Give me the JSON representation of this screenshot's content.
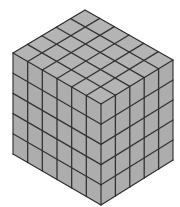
{
  "diagram": {
    "title": "",
    "block": {
      "cubes_along_left_face": 6,
      "cubes_along_right_face": 5,
      "cubes_height": 5,
      "total_cubes": 150
    },
    "geometry": {
      "top_vertex": [
        85,
        10
      ],
      "left_top_vertex": [
        13,
        53
      ],
      "right_top_vertex": [
        173,
        60
      ],
      "front_top_vertex": [
        101,
        104
      ],
      "left_bottom_vertex": [
        13,
        154
      ],
      "right_bottom_vertex": [
        173,
        160
      ],
      "front_bottom_vertex": [
        101,
        205
      ]
    },
    "colors": {
      "background": "#ffffff",
      "top_face": "#b4b4b4",
      "left_face": "#adadad",
      "right_face": "#adadad",
      "grid_line": "#333333",
      "outline": "#2a2a2a"
    }
  }
}
